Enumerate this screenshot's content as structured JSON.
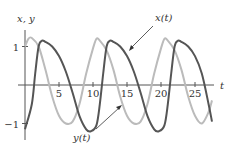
{
  "chart_data": {
    "type": "line",
    "title": "",
    "xlabel": "t",
    "ylabel": "x, y",
    "xlim": [
      0,
      28
    ],
    "ylim": [
      -1.3,
      1.3
    ],
    "xticks": [
      5,
      10,
      15,
      20,
      25
    ],
    "xtick_labels": [
      "5",
      "10",
      "15",
      "20",
      "25"
    ],
    "yticks": [
      1,
      -1
    ],
    "ytick_labels": [
      "1",
      "−1"
    ],
    "grid": false,
    "series": [
      {
        "name": "x(t)",
        "color": "#555555",
        "x": [
          0,
          1,
          1.5,
          2,
          2.5,
          3,
          4,
          5,
          6,
          7,
          8,
          9,
          9.7,
          10.5,
          11,
          11.5,
          12,
          12.5,
          13,
          14,
          15,
          16,
          17,
          18,
          19,
          19.7,
          20.5,
          21,
          21.5,
          22,
          22.5,
          23,
          24,
          25,
          26,
          27,
          27.5
        ],
        "y": [
          -1.15,
          -0.5,
          0.3,
          1.0,
          1.15,
          1.12,
          1.0,
          0.75,
          0.35,
          -0.2,
          -0.8,
          -1.15,
          -1.2,
          -1.05,
          -0.5,
          0.3,
          1.0,
          1.15,
          1.12,
          1.0,
          0.75,
          0.35,
          -0.2,
          -0.8,
          -1.15,
          -1.2,
          -1.05,
          -0.5,
          0.3,
          1.0,
          1.15,
          1.12,
          1.0,
          0.75,
          0.3,
          -0.5,
          -0.95
        ]
      },
      {
        "name": "y(t)",
        "color": "#bbbbbb",
        "x": [
          0,
          0.5,
          1,
          2,
          3,
          4,
          5,
          6,
          7,
          8,
          9,
          10,
          10.5,
          11,
          12,
          13,
          14,
          15,
          16,
          17,
          18,
          19,
          20,
          20.5,
          21,
          22,
          23,
          24,
          25,
          26,
          27,
          27.5
        ],
        "y": [
          1.0,
          1.2,
          1.22,
          1.0,
          0.4,
          -0.3,
          -0.8,
          -1.0,
          -0.95,
          -0.5,
          0.3,
          0.95,
          1.2,
          1.15,
          0.9,
          0.4,
          -0.3,
          -0.8,
          -1.0,
          -0.95,
          -0.5,
          0.3,
          0.95,
          1.2,
          1.15,
          0.9,
          0.4,
          -0.3,
          -0.8,
          -1.0,
          -0.7,
          -0.4
        ]
      }
    ],
    "annotations": [
      {
        "text": "x(t)",
        "arrow_to": [
          13.5,
          0.85
        ]
      },
      {
        "text": "y(t)",
        "arrow_to": [
          13.5,
          -0.6
        ]
      }
    ]
  },
  "labels": {
    "y_axis": "x, y",
    "x_axis": "t",
    "ytick_pos": "1",
    "ytick_neg": "−1",
    "xticks": [
      "5",
      "10",
      "15",
      "20",
      "25"
    ],
    "x_series_label": "x(t)",
    "y_series_label": "y(t)"
  }
}
